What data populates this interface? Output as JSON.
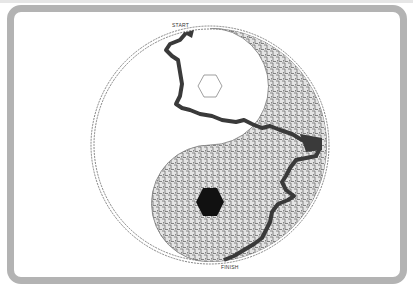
{
  "puzzle": {
    "type": "yin-yang maze",
    "start_label": "START",
    "finish_label": "FINISH",
    "colors": {
      "frame": "#b3b3b3",
      "maze_fill": "#d9d9d9",
      "maze_line": "#555555",
      "solution_path": "#3a3a3a",
      "dot": "#111111",
      "background": "#ffffff"
    }
  }
}
